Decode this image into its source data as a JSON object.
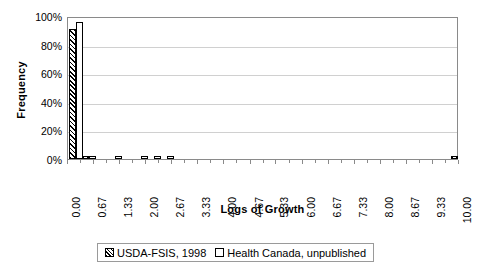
{
  "chart_data": {
    "type": "bar",
    "title": "",
    "xlabel": "Logs of Growth",
    "ylabel": "Frequency",
    "xlim": [
      0.0,
      10.0
    ],
    "ylim": [
      0,
      100
    ],
    "ytick_labels": [
      "0%",
      "20%",
      "40%",
      "60%",
      "80%",
      "100%"
    ],
    "ytick_values": [
      0,
      20,
      40,
      60,
      80,
      100
    ],
    "xtick_labels": [
      "0.00",
      "0.67",
      "1.33",
      "2.00",
      "2.67",
      "3.33",
      "4.00",
      "4.67",
      "5.33",
      "6.00",
      "6.67",
      "7.33",
      "8.00",
      "8.67",
      "9.33",
      "10.00"
    ],
    "xtick_values": [
      0.0,
      0.67,
      1.33,
      2.0,
      2.67,
      3.33,
      4.0,
      4.67,
      5.33,
      6.0,
      6.67,
      7.33,
      8.0,
      8.67,
      9.33,
      10.0
    ],
    "grid": true,
    "grid_axis": "y",
    "legend_position": "bottom",
    "series": [
      {
        "name": "USDA-FSIS, 1998",
        "fill": "hatched",
        "x": [
          0.0,
          0.33,
          10.0
        ],
        "values": [
          91,
          2,
          2
        ]
      },
      {
        "name": "Health Canada, unpublished",
        "fill": "white",
        "x": [
          0.0,
          0.33,
          1.0,
          1.67,
          2.0,
          2.33
        ],
        "values": [
          96,
          1,
          1,
          1,
          1,
          1
        ]
      }
    ]
  },
  "legend": {
    "entries": [
      {
        "label": "USDA-FSIS, 1998"
      },
      {
        "label": "Health Canada, unpublished"
      }
    ]
  }
}
